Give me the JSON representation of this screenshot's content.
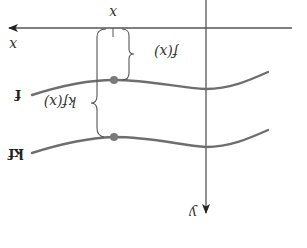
{
  "diagram": {
    "orientation": "rotated 180 degrees",
    "colors": {
      "axis": "#555555",
      "curve": "#6e6e6e",
      "brace": "#555555",
      "point": "#7a7a7a",
      "text": "#333333"
    },
    "axes": {
      "x_label": "x",
      "y_label": "y",
      "tick_label": "x"
    },
    "curves": [
      {
        "name": "f",
        "label": "f"
      },
      {
        "name": "kf",
        "label": "kf"
      }
    ],
    "braces": [
      {
        "name": "f-of-x",
        "label": "f(x)"
      },
      {
        "name": "kf-of-x",
        "label": "kf(x)"
      }
    ]
  }
}
